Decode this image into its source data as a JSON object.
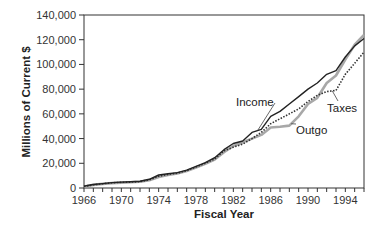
{
  "chart_data": {
    "type": "line",
    "title": "",
    "xlabel": "Fiscal Year",
    "ylabel": "Millions of Current $",
    "xlim": [
      1966,
      1996
    ],
    "ylim": [
      0,
      140000
    ],
    "x_ticks": [
      1966,
      1970,
      1974,
      1978,
      1982,
      1986,
      1990,
      1994
    ],
    "x_tick_labels": [
      "1966",
      "1970",
      "1974",
      "1978",
      "1982",
      "1986",
      "1990",
      "1994"
    ],
    "y_ticks": [
      0,
      20000,
      40000,
      60000,
      80000,
      100000,
      120000,
      140000
    ],
    "y_tick_labels": [
      "0",
      "20,000",
      "40,000",
      "60,000",
      "80,000",
      "100,000",
      "120,000",
      "140,000"
    ],
    "grid": false,
    "legend": "none (direct annotations)",
    "x": [
      1966,
      1967,
      1968,
      1969,
      1970,
      1971,
      1972,
      1973,
      1974,
      1975,
      1976,
      1977,
      1978,
      1979,
      1980,
      1981,
      1982,
      1983,
      1984,
      1985,
      1986,
      1987,
      1988,
      1989,
      1990,
      1991,
      1992,
      1993,
      1994,
      1995,
      1996
    ],
    "series": [
      {
        "name": "Income",
        "style": "solid-dark",
        "color": "#222222",
        "values": [
          1500,
          2800,
          3600,
          4400,
          4800,
          5000,
          5400,
          7000,
          10500,
          11500,
          12500,
          14500,
          17500,
          20500,
          24500,
          31000,
          36000,
          38000,
          45000,
          47500,
          58000,
          62000,
          68000,
          74000,
          80000,
          85000,
          92000,
          95000,
          106000,
          115000,
          121000
        ]
      },
      {
        "name": "Outgo",
        "style": "solid-light",
        "color": "#a8a8a8",
        "values": [
          1200,
          2500,
          3300,
          4000,
          4400,
          4700,
          5000,
          6300,
          9000,
          10500,
          11800,
          13800,
          16500,
          19500,
          23000,
          29000,
          34000,
          37000,
          40000,
          43000,
          49000,
          49500,
          50500,
          58000,
          68000,
          73000,
          85000,
          91000,
          104000,
          116000,
          124000
        ]
      },
      {
        "name": "Taxes",
        "style": "dotted",
        "color": "#333333",
        "values": [
          1300,
          2600,
          3400,
          4200,
          4600,
          4800,
          5100,
          6600,
          9500,
          11000,
          12000,
          14000,
          17000,
          20000,
          23500,
          30000,
          33000,
          35500,
          40000,
          45000,
          52000,
          56000,
          60000,
          64000,
          70000,
          75000,
          78000,
          79000,
          92000,
          101000,
          110000
        ]
      }
    ],
    "annotations": [
      {
        "text": "Income",
        "series": "Income"
      },
      {
        "text": "Outgo",
        "series": "Outgo"
      },
      {
        "text": "Taxes",
        "series": "Taxes"
      }
    ]
  }
}
